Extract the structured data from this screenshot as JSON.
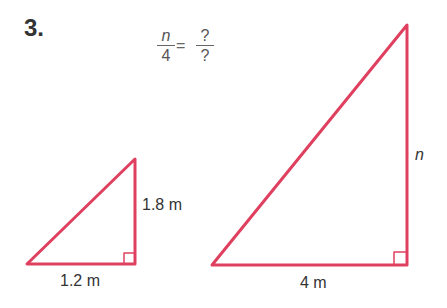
{
  "problem": {
    "number": "3.",
    "equation": {
      "left_numerator": "n",
      "left_denominator": "4",
      "equals": "=",
      "right_numerator": "?",
      "right_denominator": "?"
    }
  },
  "small_triangle": {
    "height_label": "1.8 m",
    "base_label": "1.2 m"
  },
  "large_triangle": {
    "height_label": "n",
    "base_label": "4 m"
  },
  "colors": {
    "triangle_stroke": "#e0405f",
    "text": "#333333"
  }
}
